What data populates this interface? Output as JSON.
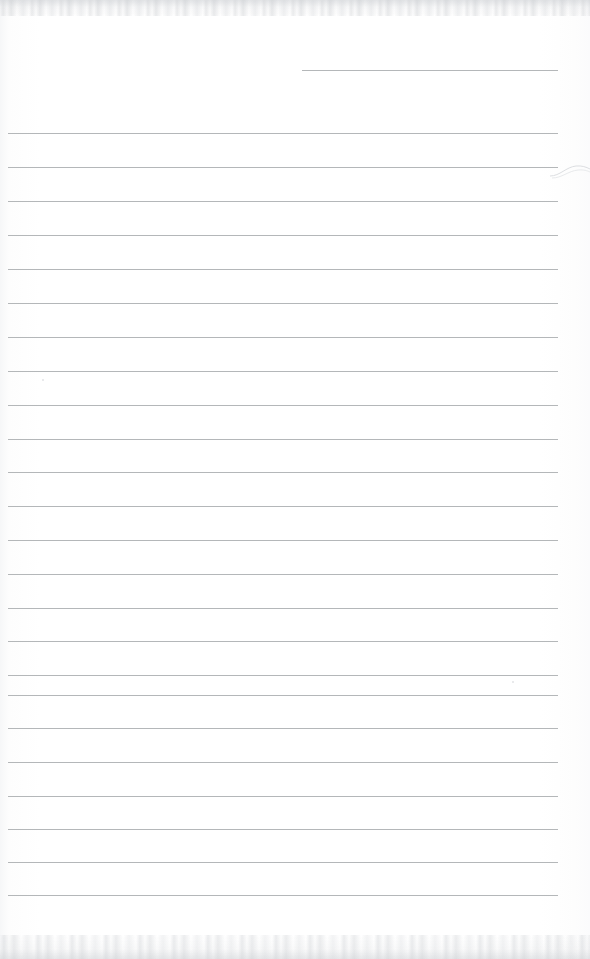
{
  "document": {
    "kind": "scanned-lined-notebook-page",
    "title": "Blank ruled notebook page",
    "page_width": 590,
    "page_height": 959,
    "written_text": "",
    "handwriting_present": false,
    "text_content": []
  },
  "paper": {
    "background_color": "#ffffff",
    "paper_tint_color": "#fdfdfd",
    "edge_tint_color": "#f6f7f8"
  },
  "ruling": {
    "line_color": "#b0b3b5",
    "line_thickness_px": 1,
    "line_spacing_px": 34,
    "full_line_left_px": 8,
    "full_line_right_px": 558,
    "full_line_count": 23,
    "full_line_y": [
      133,
      167,
      201,
      235,
      269,
      303,
      337,
      371,
      405,
      439,
      472,
      506,
      540,
      574,
      608,
      641,
      675,
      695,
      728,
      762,
      796,
      829,
      862,
      895
    ],
    "partial_lines": [
      {
        "name": "top-right-rule",
        "y": 70,
        "left_px": 302,
        "right_px": 558
      }
    ],
    "right_margin_px": 32
  },
  "artifacts": {
    "top_noise_band": {
      "y": 0,
      "height": 16,
      "color": "#ccced2"
    },
    "bottom_noise_band": {
      "y": 935,
      "height": 24,
      "color": "#ccced2"
    },
    "left_edge_shadow": {
      "x": 0,
      "width": 9,
      "color": "#f3f4f6"
    },
    "specks": [
      {
        "name": "speck-upper-left",
        "x": 42,
        "y": 379,
        "size": 2
      },
      {
        "name": "speck-mid-right",
        "x": 512,
        "y": 681,
        "size": 2
      }
    ],
    "edge_curl": {
      "name": "right-edge-curl",
      "x": 552,
      "y": 160,
      "color": "#dcdee1"
    }
  }
}
